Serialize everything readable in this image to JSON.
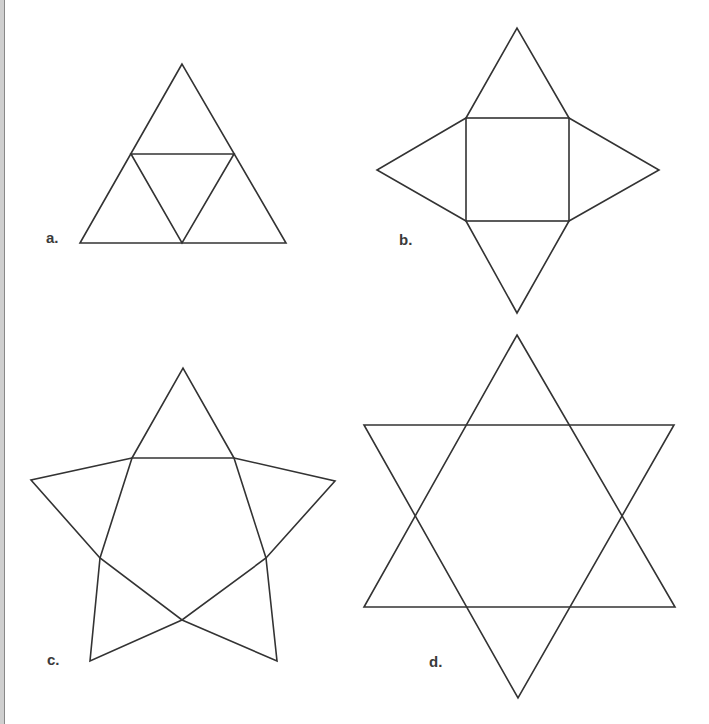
{
  "page": {
    "top_caption_clipped": "",
    "border_color": "#888888"
  },
  "figure": {
    "stroke_color": "#333333",
    "label_color": "#3a3a3a",
    "panels": [
      {
        "id": "a",
        "label": "a.",
        "description": "Equilateral triangle subdivided into four triangles (tetrahedron net)"
      },
      {
        "id": "b",
        "label": "b.",
        "description": "Square with four triangles attached to each side (square pyramid net)"
      },
      {
        "id": "c",
        "label": "c.",
        "description": "Pentagon with five triangles attached (pentagonal pyramid net / star)"
      },
      {
        "id": "d",
        "label": "d.",
        "description": "Hexagram formed by two overlapping equilateral triangles"
      }
    ]
  }
}
